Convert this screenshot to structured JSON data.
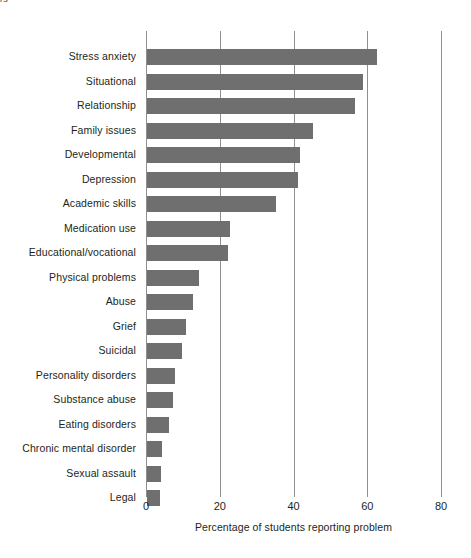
{
  "clipped_caption": "rs",
  "chart_data": {
    "type": "bar",
    "orientation": "horizontal",
    "title": "",
    "subtitle": "",
    "xlabel": "Percentage of students reporting problem",
    "ylabel": "",
    "xlim": [
      0,
      80
    ],
    "xticks": [
      "0",
      "20",
      "40",
      "60",
      "80"
    ],
    "xtick_values": [
      0,
      20,
      40,
      60,
      80
    ],
    "grid": "vertical",
    "legend": "none",
    "bar_color": "#6f6f6f",
    "gridline_color": "#8f8f8f",
    "categories": [
      "Stress anxiety",
      "Situational",
      "Relationship",
      "Family issues",
      "Developmental",
      "Depression",
      "Academic skills",
      "Medication use",
      "Educational/vocational",
      "Physical problems",
      "Abuse",
      "Grief",
      "Suicidal",
      "Personality disorders",
      "Substance abuse",
      "Eating disorders",
      "Chronic mental disorder",
      "Sexual assault",
      "Legal"
    ],
    "values": [
      62.5,
      58.5,
      56.5,
      45,
      41.5,
      41,
      35,
      22.5,
      22,
      14,
      12.5,
      10.5,
      9.5,
      7.5,
      7,
      6,
      4,
      3.8,
      3.5
    ]
  }
}
